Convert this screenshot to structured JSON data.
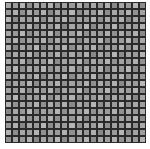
{
  "image": {
    "subject": "grey mosaic tile sheet",
    "grid": {
      "columns": 20,
      "rows": 20
    },
    "colors": {
      "grout": "#2a2a2a",
      "background": "#ffffff",
      "tile_light": "#b8b8b8",
      "tile_dark": "#7e7e7e"
    }
  },
  "tiles": [
    "#a4a4a4",
    "#8e8e8e",
    "#b2b2b2",
    "#9a9a9a",
    "#aaaaaa",
    "#888888",
    "#b6b6b6",
    "#9c9c9c",
    "#a8a8a8",
    "#929292",
    "#b0b0b0",
    "#989898",
    "#a6a6a6",
    "#8c8c8c",
    "#b4b4b4",
    "#9e9e9e",
    "#a2a2a2",
    "#909090",
    "#b0b0b0",
    "#9a9a9a"
  ]
}
